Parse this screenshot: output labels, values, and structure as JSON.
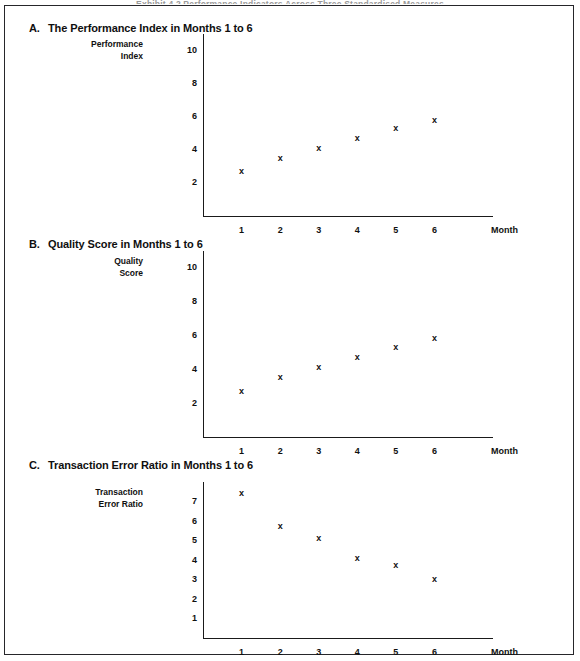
{
  "page": {
    "top_cut_title": "Exhibit 4.2  Performance Indicators Across Three Standardised Measures"
  },
  "figure": {
    "marker_glyph": "x",
    "axis_color": "#1a1a1a",
    "text_color": "#101010",
    "charts": [
      {
        "letter": "A.",
        "title": "The Performance Index in Months 1 to 6",
        "y_axis_title_line1": "Performance",
        "y_axis_title_line2": "Index",
        "x_axis_label": "Month"
      },
      {
        "letter": "B.",
        "title": "Quality Score in Months 1 to 6",
        "y_axis_title_line1": "Quality",
        "y_axis_title_line2": "Score",
        "x_axis_label": "Month"
      },
      {
        "letter": "C.",
        "title": "Transaction Error Ratio in Months 1 to 6",
        "y_axis_title_line1": "Transaction",
        "y_axis_title_line2": "Error Ratio",
        "x_axis_label": "Month"
      }
    ]
  },
  "chart_data": [
    {
      "type": "scatter",
      "panel": "A",
      "title": "The Performance Index in Months 1 to 6",
      "xlabel": "Month",
      "ylabel": "Performance Index",
      "x": [
        1,
        2,
        3,
        4,
        5,
        6
      ],
      "values": [
        2.7,
        3.5,
        4.1,
        4.7,
        5.3,
        5.8
      ],
      "xtick_labels": [
        "1",
        "2",
        "3",
        "4",
        "5",
        "6"
      ],
      "ytick_labels": [
        "2",
        "4",
        "6",
        "8",
        "10"
      ],
      "yticks": [
        2,
        4,
        6,
        8,
        10
      ],
      "ylim": [
        0,
        11
      ],
      "xlim": [
        0,
        7
      ],
      "grid": false,
      "legend": false,
      "marker": "x"
    },
    {
      "type": "scatter",
      "panel": "B",
      "title": "Quality Score in Months 1 to 6",
      "xlabel": "Month",
      "ylabel": "Quality Score",
      "x": [
        1,
        2,
        3,
        4,
        5,
        6
      ],
      "values": [
        2.7,
        3.5,
        4.1,
        4.7,
        5.3,
        5.8
      ],
      "xtick_labels": [
        "1",
        "2",
        "3",
        "4",
        "5",
        "6"
      ],
      "ytick_labels": [
        "2",
        "4",
        "6",
        "8",
        "10"
      ],
      "yticks": [
        2,
        4,
        6,
        8,
        10
      ],
      "ylim": [
        0,
        11
      ],
      "xlim": [
        0,
        7
      ],
      "grid": false,
      "legend": false,
      "marker": "x"
    },
    {
      "type": "scatter",
      "panel": "C",
      "title": "Transaction Error Ratio in Months 1 to 6",
      "xlabel": "Month",
      "ylabel": "Transaction Error Ratio",
      "x": [
        1,
        2,
        3,
        4,
        5,
        6
      ],
      "values": [
        7.4,
        5.7,
        5.1,
        4.1,
        3.7,
        3.0
      ],
      "xtick_labels": [
        "1",
        "2",
        "3",
        "4",
        "5",
        "6"
      ],
      "ytick_labels": [
        "1",
        "2",
        "3",
        "4",
        "5",
        "6",
        "7"
      ],
      "yticks": [
        1,
        2,
        3,
        4,
        5,
        6,
        7
      ],
      "ylim": [
        0,
        8
      ],
      "xlim": [
        0,
        7
      ],
      "grid": false,
      "legend": false,
      "marker": "x"
    }
  ]
}
